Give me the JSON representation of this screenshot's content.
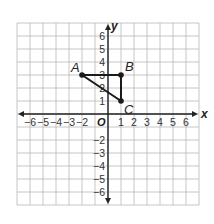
{
  "diagram": {
    "type": "coordinate_plane",
    "axes": {
      "x_label": "x",
      "y_label": "y",
      "origin_label": "O",
      "x_range": [
        -7,
        7
      ],
      "y_range": [
        -7,
        7
      ],
      "x_ticks": [
        -6,
        -5,
        -4,
        -3,
        -2,
        1,
        2,
        3,
        4,
        5,
        6
      ],
      "y_ticks": [
        6,
        5,
        4,
        3,
        2,
        1,
        -2,
        -3,
        -4,
        -5,
        -6
      ],
      "x_tick_labels": [
        "−6",
        "−5",
        "−4",
        "−3",
        "−2",
        "1",
        "2",
        "3",
        "4",
        "5",
        "6"
      ],
      "y_tick_labels": [
        "6",
        "5",
        "4",
        "3",
        "2",
        "1",
        "−2",
        "−3",
        "−4",
        "−5",
        "−6"
      ]
    },
    "points": [
      {
        "label": "A",
        "x": -2,
        "y": 3
      },
      {
        "label": "B",
        "x": 1,
        "y": 3
      },
      {
        "label": "C",
        "x": 1,
        "y": 1
      }
    ],
    "segments": [
      [
        "A",
        "B"
      ],
      [
        "B",
        "C"
      ],
      [
        "C",
        "A"
      ]
    ],
    "colors": {
      "grid": "#b8b8b8",
      "axis": "#222222",
      "shape": "#1a1a1a"
    }
  }
}
